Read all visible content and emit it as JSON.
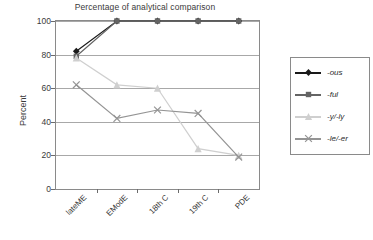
{
  "chart_data": {
    "type": "line",
    "title": "Percentage of analytical comparison",
    "xlabel": "",
    "ylabel": "Percent",
    "ylim": [
      0,
      100
    ],
    "yticks": [
      0,
      20,
      40,
      60,
      80,
      100
    ],
    "grid": true,
    "legend_position": "right",
    "categories": [
      "lateME",
      "EModE",
      "18th C",
      "19th C",
      "PDE"
    ],
    "series": [
      {
        "name": "-ous",
        "marker": "diamond",
        "color": "#1a1a1a",
        "values": [
          82,
          100,
          100,
          100,
          100
        ]
      },
      {
        "name": "-ful",
        "marker": "square",
        "color": "#646464",
        "values": [
          79,
          100,
          100,
          100,
          100
        ]
      },
      {
        "name": "-y/-ly",
        "marker": "triangle",
        "color": "#cfcfcf",
        "values": [
          78,
          62,
          60,
          24,
          20
        ]
      },
      {
        "name": "-le/-er",
        "marker": "cross",
        "color": "#949494",
        "values": [
          62,
          42,
          47,
          45,
          19
        ]
      }
    ]
  },
  "axis": {
    "y_title": "Percent",
    "y_tick_labels": [
      "100",
      "80",
      "60",
      "40",
      "20",
      "0"
    ],
    "x_tick_labels": [
      "lateME",
      "EModE",
      "18th C",
      "19th C",
      "PDE"
    ]
  },
  "legend": {
    "entries": [
      {
        "label": "-ous"
      },
      {
        "label": "-ful"
      },
      {
        "label": "-y/-ly"
      },
      {
        "label": "-le/-er"
      }
    ]
  }
}
